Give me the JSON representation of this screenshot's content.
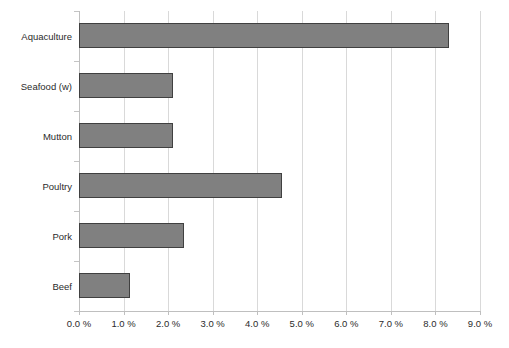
{
  "chart_data": {
    "type": "bar",
    "orientation": "horizontal",
    "title": "",
    "subtitle": "",
    "xlabel": "",
    "ylabel": "",
    "categories": [
      "Beef",
      "Pork",
      "Poultry",
      "Mutton",
      "Seafood (w)",
      "Aquaculture"
    ],
    "values": [
      1.15,
      2.35,
      4.55,
      2.1,
      2.1,
      8.3
    ],
    "value_unit": "%",
    "xlim": [
      0,
      9
    ],
    "x_tick_values": [
      0,
      1,
      2,
      3,
      4,
      5,
      6,
      7,
      8,
      9
    ],
    "x_tick_labels": [
      "0.0 %",
      "1.0 %",
      "2.0 %",
      "3.0 %",
      "4.0 %",
      "5.0 %",
      "6.0 %",
      "7.0 %",
      "8.0 %",
      "9.0 %"
    ],
    "grid": true,
    "grid_axis": "x",
    "legend": false,
    "legend_position": "none",
    "series": [
      {
        "name": "",
        "values": [
          1.15,
          2.35,
          4.55,
          2.1,
          2.1,
          8.3
        ]
      }
    ],
    "bars": [
      {
        "category": "Aquaculture",
        "value": 8.3,
        "label": ""
      },
      {
        "category": "Seafood (w)",
        "value": 2.1,
        "label": ""
      },
      {
        "category": "Mutton",
        "value": 2.1,
        "label": ""
      },
      {
        "category": "Poultry",
        "value": 4.55,
        "label": ""
      },
      {
        "category": "Pork",
        "value": 2.35,
        "label": ""
      },
      {
        "category": "Beef",
        "value": 1.15,
        "label": ""
      }
    ],
    "colors": {
      "bar_fill": "#808080",
      "bar_border": "#404040",
      "gridline": "#d9d9d9",
      "axis_line": "#bfbfbf",
      "text": "#2b2b2b",
      "background": "#ffffff"
    }
  }
}
